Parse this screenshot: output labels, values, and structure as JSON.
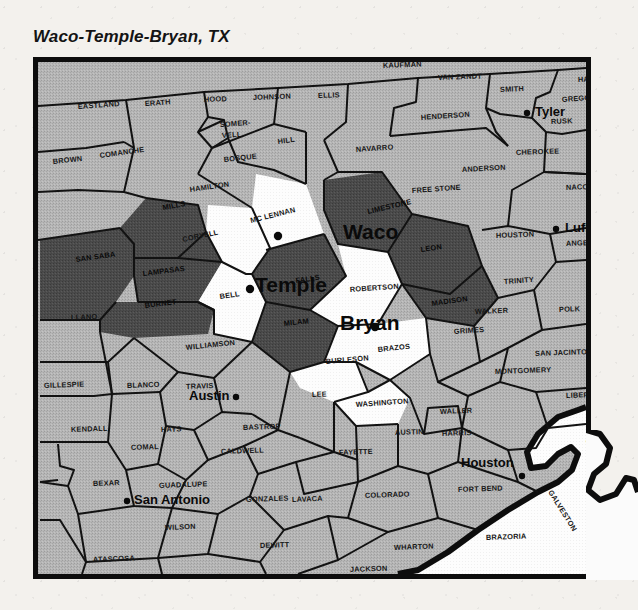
{
  "map": {
    "title": "Waco-Temple-Bryan, TX",
    "region_name": "Waco-Temple-Bryan",
    "state": "TX",
    "legend": {
      "highlight_fill": "#ffffff",
      "adjacent_fill": "#4a4a4a",
      "other_fill": "#b4b4b4",
      "water_fill": "#fbfbfb",
      "border_color": "#0d0d0d"
    },
    "cities": [
      {
        "name": "Waco",
        "label_x": 305,
        "label_y": 177,
        "dot_x": 240,
        "dot_y": 174,
        "dot_side": "left",
        "size": "large"
      },
      {
        "name": "Temple",
        "label_x": 217,
        "label_y": 230,
        "dot_x": 212,
        "dot_y": 227,
        "dot_side": "left",
        "size": "large"
      },
      {
        "name": "Bryan",
        "label_x": 302,
        "label_y": 268,
        "dot_x": 337,
        "dot_y": 265,
        "dot_side": "right",
        "size": "large"
      },
      {
        "name": "Tyler",
        "label_x": 497,
        "label_y": 54,
        "dot_x": 489,
        "dot_y": 51,
        "dot_side": "left",
        "size": "small"
      },
      {
        "name": "Lufkin",
        "label_x": 527,
        "label_y": 170,
        "dot_x": 518,
        "dot_y": 167,
        "dot_side": "left",
        "size": "small"
      },
      {
        "name": "Austin",
        "label_x": 151,
        "label_y": 338,
        "dot_x": 198,
        "dot_y": 335,
        "dot_side": "right",
        "size": "small"
      },
      {
        "name": "San Antonio",
        "label_x": 96,
        "label_y": 442,
        "dot_x": 89,
        "dot_y": 439,
        "dot_side": "left",
        "size": "small"
      },
      {
        "name": "Houston",
        "label_x": 423,
        "label_y": 405,
        "dot_x": 484,
        "dot_y": 414,
        "dot_side": "right",
        "size": "small"
      }
    ],
    "counties_highlight": [
      {
        "name": "MC LENNAN",
        "x": 213,
        "y": 161,
        "rot": -14
      },
      {
        "name": "CORYELL",
        "x": 145,
        "y": 180,
        "rot": -12
      },
      {
        "name": "BELL",
        "x": 182,
        "y": 237,
        "rot": -8
      },
      {
        "name": "ROBERTSON",
        "x": 312,
        "y": 230,
        "rot": -4
      },
      {
        "name": "BRAZOS",
        "x": 340,
        "y": 290,
        "rot": -6
      },
      {
        "name": "WASHINGTON",
        "x": 318,
        "y": 345,
        "rot": -4
      },
      {
        "name": "BURLESON",
        "x": 288,
        "y": 302,
        "rot": -5
      }
    ],
    "counties_adjacent": [
      {
        "name": "MILLS",
        "x": 125,
        "y": 148,
        "rot": -10
      },
      {
        "name": "SAN SABA",
        "x": 38,
        "y": 200,
        "rot": -8
      },
      {
        "name": "LAMPASAS",
        "x": 105,
        "y": 214,
        "rot": -7
      },
      {
        "name": "BURNET",
        "x": 107,
        "y": 246,
        "rot": -7
      },
      {
        "name": "FALLS",
        "x": 258,
        "y": 221,
        "rot": -8
      },
      {
        "name": "LIMESTONE",
        "x": 330,
        "y": 152,
        "rot": -13
      },
      {
        "name": "MILAM",
        "x": 246,
        "y": 264,
        "rot": -6
      },
      {
        "name": "LEON",
        "x": 383,
        "y": 190,
        "rot": -8
      },
      {
        "name": "MADISON",
        "x": 394,
        "y": 244,
        "rot": -8
      }
    ],
    "counties_other": [
      {
        "name": "EASTLAND",
        "x": 40,
        "y": 47,
        "rot": -4
      },
      {
        "name": "ERATH",
        "x": 107,
        "y": 44,
        "rot": -4
      },
      {
        "name": "HOOD",
        "x": 166,
        "y": 40,
        "rot": -2
      },
      {
        "name": "JOHNSON",
        "x": 215,
        "y": 38,
        "rot": -2
      },
      {
        "name": "ELLIS",
        "x": 280,
        "y": 36,
        "rot": -2
      },
      {
        "name": "KAUFMAN",
        "x": 345,
        "y": 6,
        "rot": -2
      },
      {
        "name": "VAN ZANDT",
        "x": 400,
        "y": 18,
        "rot": -2
      },
      {
        "name": "SMITH",
        "x": 462,
        "y": 30,
        "rot": -2
      },
      {
        "name": "HARRISON",
        "x": 540,
        "y": 20,
        "rot": -2
      },
      {
        "name": "GREGG",
        "x": 524,
        "y": 40,
        "rot": -4
      },
      {
        "name": "RUSK",
        "x": 513,
        "y": 62,
        "rot": -2
      },
      {
        "name": "PANOLA",
        "x": 563,
        "y": 62,
        "rot": -2
      },
      {
        "name": "BROWN",
        "x": 15,
        "y": 102,
        "rot": -6
      },
      {
        "name": "COMANCHE",
        "x": 62,
        "y": 96,
        "rot": -8
      },
      {
        "name": "SOMER-",
        "x": 182,
        "y": 65,
        "rot": -4
      },
      {
        "name": "VELL",
        "x": 184,
        "y": 76,
        "rot": -4
      },
      {
        "name": "HILL",
        "x": 240,
        "y": 82,
        "rot": -8
      },
      {
        "name": "BOSQUE",
        "x": 186,
        "y": 100,
        "rot": -6
      },
      {
        "name": "HAMILTON",
        "x": 152,
        "y": 130,
        "rot": -8
      },
      {
        "name": "NAVARRO",
        "x": 318,
        "y": 90,
        "rot": -4
      },
      {
        "name": "HENDERSON",
        "x": 383,
        "y": 58,
        "rot": -4
      },
      {
        "name": "CHEROKEE",
        "x": 478,
        "y": 93,
        "rot": -2
      },
      {
        "name": "ANDERSON",
        "x": 424,
        "y": 110,
        "rot": -3
      },
      {
        "name": "FREE STONE",
        "x": 374,
        "y": 131,
        "rot": -4
      },
      {
        "name": "NACOGDOCHES",
        "x": 528,
        "y": 128,
        "rot": -2
      },
      {
        "name": "ANGELINA",
        "x": 528,
        "y": 184,
        "rot": -2
      },
      {
        "name": "HOUSTON",
        "x": 458,
        "y": 176,
        "rot": -2
      },
      {
        "name": "TRINITY",
        "x": 466,
        "y": 222,
        "rot": -4
      },
      {
        "name": "POLK",
        "x": 521,
        "y": 250,
        "rot": -2
      },
      {
        "name": "TYLER",
        "x": 573,
        "y": 232,
        "rot": -2
      },
      {
        "name": "HARDIN",
        "x": 578,
        "y": 298,
        "rot": -2
      },
      {
        "name": "SAN JACINTO",
        "x": 497,
        "y": 294,
        "rot": -2
      },
      {
        "name": "WALKER",
        "x": 437,
        "y": 252,
        "rot": -2
      },
      {
        "name": "GRIMES",
        "x": 416,
        "y": 272,
        "rot": -4
      },
      {
        "name": "MONTGOMERY",
        "x": 457,
        "y": 312,
        "rot": -2
      },
      {
        "name": "LIBERTY",
        "x": 528,
        "y": 336,
        "rot": -2
      },
      {
        "name": "WALLER",
        "x": 402,
        "y": 352,
        "rot": -2
      },
      {
        "name": "HARRIS",
        "x": 404,
        "y": 374,
        "rot": -2
      },
      {
        "name": "CHAMBERS",
        "x": 548,
        "y": 382,
        "rot": -2
      },
      {
        "name": "GALVESTON",
        "x": 510,
        "y": 430,
        "rot": 58
      },
      {
        "name": "FORT BEND",
        "x": 420,
        "y": 430,
        "rot": -2
      },
      {
        "name": "BRAZORIA",
        "x": 448,
        "y": 478,
        "rot": -2
      },
      {
        "name": "MATAGORDA",
        "x": 385,
        "y": 523,
        "rot": -2
      },
      {
        "name": "WHARTON",
        "x": 356,
        "y": 488,
        "rot": -2
      },
      {
        "name": "JACKSON",
        "x": 312,
        "y": 510,
        "rot": -2
      },
      {
        "name": "COLORADO",
        "x": 327,
        "y": 436,
        "rot": -2
      },
      {
        "name": "LAVACA",
        "x": 254,
        "y": 440,
        "rot": -2
      },
      {
        "name": "AUSTIN",
        "x": 357,
        "y": 373,
        "rot": -2
      },
      {
        "name": "LEE",
        "x": 274,
        "y": 335,
        "rot": -2
      },
      {
        "name": "FAYETTE",
        "x": 301,
        "y": 393,
        "rot": -2
      },
      {
        "name": "GONZALES",
        "x": 208,
        "y": 440,
        "rot": -2
      },
      {
        "name": "CALDWELL",
        "x": 183,
        "y": 392,
        "rot": -2
      },
      {
        "name": "BASTROP",
        "x": 205,
        "y": 368,
        "rot": -2
      },
      {
        "name": "TRAVIS",
        "x": 148,
        "y": 327,
        "rot": -2
      },
      {
        "name": "HAYS",
        "x": 123,
        "y": 370,
        "rot": -2
      },
      {
        "name": "BLANCO",
        "x": 89,
        "y": 326,
        "rot": -2
      },
      {
        "name": "GILLESPIE",
        "x": 6,
        "y": 326,
        "rot": -2
      },
      {
        "name": "KENDALL",
        "x": 33,
        "y": 370,
        "rot": -2
      },
      {
        "name": "COMAL",
        "x": 93,
        "y": 388,
        "rot": -2
      },
      {
        "name": "GUADALUPE",
        "x": 121,
        "y": 426,
        "rot": -2
      },
      {
        "name": "BEXAR",
        "x": 55,
        "y": 424,
        "rot": -2
      },
      {
        "name": "WILSON",
        "x": 127,
        "y": 468,
        "rot": -2
      },
      {
        "name": "ATASCOSA",
        "x": 55,
        "y": 500,
        "rot": -2
      },
      {
        "name": "KARNES",
        "x": 152,
        "y": 518,
        "rot": -2
      },
      {
        "name": "DEWITT",
        "x": 222,
        "y": 486,
        "rot": -2
      },
      {
        "name": "WILLIAMSON",
        "x": 148,
        "y": 288,
        "rot": -6
      },
      {
        "name": "LLANO",
        "x": 33,
        "y": 258,
        "rot": -2
      }
    ]
  }
}
